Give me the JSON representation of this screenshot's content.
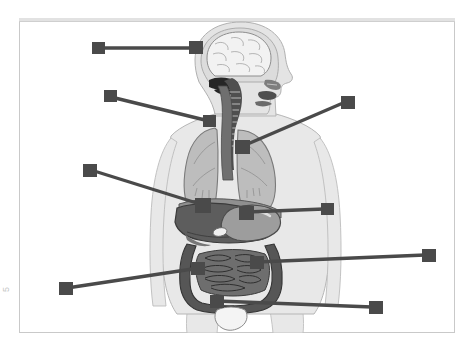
{
  "page": {
    "background_color": "#ffffff",
    "margin_mark": "5"
  },
  "frame": {
    "border_color": "#c9c9c9",
    "fill_color": "#ffffff",
    "top_band_color": "#e2e2e2"
  },
  "diagram": {
    "type": "anatomy-worksheet",
    "style": "grayscale",
    "palette": {
      "body_silhouette": "#e8e8e8",
      "body_outline": "#b6b6b6",
      "skull_fill": "#dcdcdc",
      "brain_fill": "#f2f2f2",
      "brain_outline": "#8e8e8e",
      "cerebellum_fill": "#262626",
      "airway_fill": "#4f4f4f",
      "lung_fill": "#bdbdbd",
      "lung_outline": "#7a7a7a",
      "diaphragm_fill": "#8f8f8f",
      "liver_fill": "#5d5d5d",
      "stomach_fill": "#9d9d9d",
      "gallbladder_fill": "#efefef",
      "intestine_fill": "#6e6e6e",
      "colon_fill": "#565656",
      "bladder_fill": "#f4f4f4",
      "leader_color": "#4a4a4a"
    },
    "organs": [
      {
        "name": "brain",
        "label": ""
      },
      {
        "name": "cerebellum",
        "label": ""
      },
      {
        "name": "nasal-cavity",
        "label": ""
      },
      {
        "name": "mouth-tongue",
        "label": ""
      },
      {
        "name": "trachea",
        "label": ""
      },
      {
        "name": "esophagus",
        "label": ""
      },
      {
        "name": "left-lung",
        "label": ""
      },
      {
        "name": "right-lung",
        "label": ""
      },
      {
        "name": "diaphragm",
        "label": ""
      },
      {
        "name": "liver",
        "label": ""
      },
      {
        "name": "stomach",
        "label": ""
      },
      {
        "name": "gallbladder",
        "label": ""
      },
      {
        "name": "small-intestine",
        "label": ""
      },
      {
        "name": "large-intestine",
        "label": ""
      },
      {
        "name": "rectum",
        "label": ""
      },
      {
        "name": "bladder",
        "label": ""
      }
    ],
    "leaders": [
      {
        "id": "leader-brain",
        "target_organ": "brain",
        "label": "",
        "x1": 75,
        "y1": 30,
        "x2": 178,
        "y2": 30,
        "box_end": "both"
      },
      {
        "id": "leader-trachea",
        "target_organ": "trachea",
        "label": "",
        "x1": 87,
        "y1": 78,
        "x2": 190,
        "y2": 103,
        "box_end": "both"
      },
      {
        "id": "leader-lung",
        "target_organ": "left-lung",
        "label": "",
        "x1": 329,
        "y1": 84,
        "x2": 221,
        "y2": 128,
        "box_end": "both"
      },
      {
        "id": "leader-liver",
        "target_organ": "liver",
        "label": "",
        "x1": 66,
        "y1": 151,
        "x2": 182,
        "y2": 186,
        "box_end": "both"
      },
      {
        "id": "leader-stomach",
        "target_organ": "stomach",
        "label": "",
        "x1": 309,
        "y1": 191,
        "x2": 224,
        "y2": 194,
        "box_end": "both"
      },
      {
        "id": "leader-large-intestine",
        "target_organ": "large-intestine",
        "label": "",
        "x1": 410,
        "y1": 237,
        "x2": 234,
        "y2": 244,
        "box_end": "both"
      },
      {
        "id": "leader-small-intestine",
        "target_organ": "small-intestine",
        "label": "",
        "x1": 42,
        "y1": 270,
        "x2": 177,
        "y2": 250,
        "box_end": "both"
      },
      {
        "id": "leader-bladder",
        "target_organ": "bladder",
        "label": "",
        "x1": 357,
        "y1": 289,
        "x2": 195,
        "y2": 283,
        "box_end": "both"
      }
    ],
    "leader_count": 8
  }
}
